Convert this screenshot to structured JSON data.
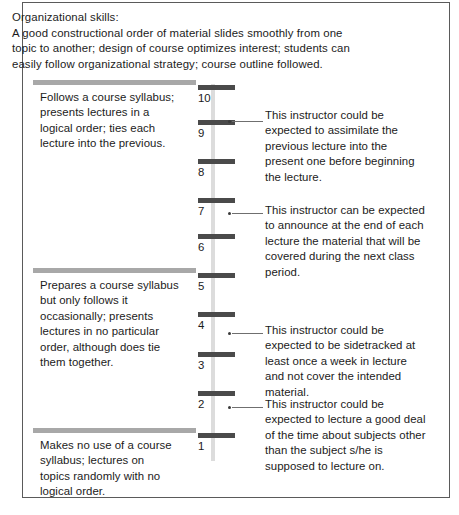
{
  "header": {
    "title": "Organizational skills:",
    "line1": "A good constructional order of material slides smoothly from one",
    "line2": "topic to another; design of course optimizes interest; students can",
    "line3": "easily follow organizational strategy; course outline followed."
  },
  "scale": {
    "numbers": [
      "10",
      "9",
      "8",
      "7",
      "6",
      "5",
      "4",
      "3",
      "2",
      "1"
    ],
    "rail_color": "#dcdcdc",
    "tick_color": "#4a4a4a"
  },
  "anchors": [
    {
      "id": "high",
      "rule_color": "#a8a8a8",
      "text": "Follows a course syllabus;\npresents lectures in a\nlogical order; ties each\nlecture into the previous."
    },
    {
      "id": "mid",
      "rule_color": "#a8a8a8",
      "text": "Prepares a course syllabus\nbut only follows it\noccasionally; presents\nlectures in no particular\norder, although does tie\nthem together."
    },
    {
      "id": "low",
      "rule_color": "#a8a8a8",
      "text": "Makes no use of a course\nsyllabus; lectures on\ntopics randomly with no\nlogical order."
    }
  ],
  "descriptors": [
    {
      "anchor_point": "9",
      "text": "This instructor could be\nexpected to assimilate the\nprevious lecture into the\npresent one before beginning\nthe lecture."
    },
    {
      "anchor_point": "7",
      "text": "This instructor can be expected\nto announce at the end of each\nlecture the material that will be\ncovered during the next class\nperiod."
    },
    {
      "anchor_point": "4",
      "text": "This instructor could be\nexpected to be sidetracked at\nleast once a week in lecture\nand not cover the intended\nmaterial."
    },
    {
      "anchor_point": "2",
      "text": "This instructor could be\nexpected to lecture a good deal\nof the time about subjects other\nthan the subject s/he is\nsupposed to lecture on."
    }
  ]
}
